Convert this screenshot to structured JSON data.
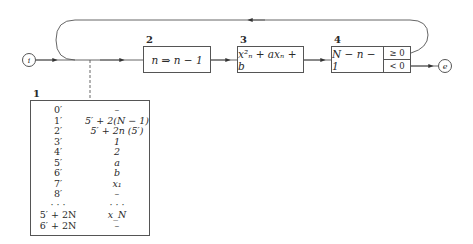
{
  "diagram": {
    "start_node": "i",
    "end_node": "e",
    "blocks": [
      {
        "number": "2",
        "label": "n ⇒ n − 1"
      },
      {
        "number": "3",
        "label": "x²ₙ + axₙ + b"
      },
      {
        "number": "4",
        "label": "N − n − 1",
        "branches": [
          "≥ 0",
          "< 0"
        ]
      }
    ],
    "memory_table": {
      "number": "1",
      "rows": [
        {
          "addr": "0′",
          "value": "–"
        },
        {
          "addr": "1′",
          "value": "5′ + 2(N − 1)"
        },
        {
          "addr": "2′",
          "value": "5′ + 2n   (5′)"
        },
        {
          "addr": "3′",
          "value": "1"
        },
        {
          "addr": "4′",
          "value": "2"
        },
        {
          "addr": "5′",
          "value": "a"
        },
        {
          "addr": "6′",
          "value": "b"
        },
        {
          "addr": "7′",
          "value": "x₁"
        },
        {
          "addr": "8′",
          "value": "–"
        },
        {
          "addr": "· · ·",
          "value": "· · ·"
        },
        {
          "addr": "5′ + 2N",
          "value": "x_N"
        },
        {
          "addr": "6′ + 2N",
          "value": "–"
        }
      ]
    }
  }
}
